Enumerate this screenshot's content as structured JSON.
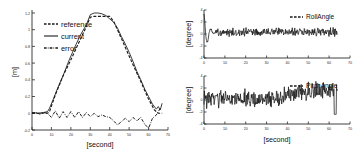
{
  "figure": {
    "background": "#ffffff",
    "foreground": "#1a1a1a"
  },
  "chart_data": [
    {
      "id": "position-tracking",
      "type": "line",
      "title": "",
      "xlabel": "[second]",
      "ylabel": "[m]",
      "xlim": [
        0,
        70
      ],
      "ylim": [
        -0.2,
        1.2
      ],
      "xticks": [
        0,
        10,
        20,
        30,
        40,
        50,
        60,
        70
      ],
      "xticklabels": [
        "0",
        "10",
        "20",
        "30",
        "40",
        "50",
        "60",
        "70"
      ],
      "yticks": [
        -0.2,
        0,
        0.2,
        0.4,
        0.6,
        0.8,
        1,
        1.2
      ],
      "yticklabels": [
        "-0.2",
        "0",
        "0.2",
        "0.4",
        "0.6",
        "0.8",
        "1",
        "1.2"
      ],
      "grid": false,
      "legend_position": "upper-left",
      "series": [
        {
          "name": "reference",
          "style": "dashed",
          "x": [
            0,
            4,
            8,
            9,
            12,
            16,
            20,
            24,
            28,
            30,
            32,
            36,
            40,
            42,
            44,
            48,
            52,
            56,
            60,
            63,
            65,
            67
          ],
          "values": [
            0,
            0,
            0,
            0.02,
            0.22,
            0.45,
            0.64,
            0.84,
            1.04,
            1.15,
            1.16,
            1.16,
            1.16,
            1.1,
            1.0,
            0.79,
            0.58,
            0.38,
            0.17,
            0.04,
            0.0,
            0.0
          ]
        },
        {
          "name": "current",
          "style": "solid",
          "x": [
            0,
            3,
            6,
            8,
            9,
            11,
            13,
            16,
            19,
            22,
            25,
            28,
            30,
            32,
            34,
            36,
            38,
            40,
            42,
            44,
            46,
            48,
            50,
            52,
            54,
            56,
            58,
            60,
            62,
            64,
            65,
            66,
            67
          ],
          "values": [
            0.01,
            0.0,
            0.01,
            0.02,
            0.06,
            0.17,
            0.29,
            0.45,
            0.63,
            0.79,
            0.94,
            1.06,
            1.18,
            1.2,
            1.2,
            1.19,
            1.17,
            1.13,
            1.09,
            1.02,
            0.92,
            0.83,
            0.73,
            0.62,
            0.5,
            0.4,
            0.29,
            0.2,
            0.11,
            0.05,
            0.08,
            0.04,
            0.12
          ]
        },
        {
          "name": "error",
          "style": "dashdot",
          "x": [
            0,
            2,
            4,
            6,
            8,
            10,
            12,
            14,
            16,
            18,
            20,
            22,
            24,
            26,
            28,
            30,
            32,
            34,
            36,
            38,
            40,
            42,
            44,
            46,
            48,
            50,
            52,
            54,
            56,
            58,
            60,
            62,
            64,
            66
          ],
          "values": [
            0.0,
            0.01,
            -0.01,
            0.01,
            0.0,
            -0.05,
            0.03,
            -0.06,
            0.02,
            -0.05,
            0.02,
            -0.05,
            0.02,
            -0.05,
            0.01,
            -0.04,
            0.0,
            -0.04,
            -0.02,
            -0.04,
            -0.05,
            -0.09,
            -0.14,
            -0.1,
            -0.06,
            -0.1,
            -0.05,
            -0.09,
            -0.05,
            -0.13,
            -0.18,
            -0.06,
            -0.02,
            0.06
          ]
        }
      ]
    },
    {
      "id": "roll-angle",
      "type": "line",
      "title": "",
      "xlabel": "",
      "ylabel": "[degree]",
      "xlim": [
        0,
        70
      ],
      "ylim": [
        -4,
        4
      ],
      "xticks": [
        0,
        10,
        20,
        30,
        40,
        50,
        60,
        70
      ],
      "xticklabels": [
        "0",
        "10",
        "20",
        "30",
        "40",
        "50",
        "60",
        "70"
      ],
      "yticks": [
        -4,
        -2,
        0,
        2,
        4
      ],
      "yticklabels": [
        "-4",
        "-2",
        "0",
        "2",
        "4"
      ],
      "grid": false,
      "legend_position": "upper-right",
      "series": [
        {
          "name": "RollAngle",
          "style": "dashed",
          "mean": 0.35,
          "noise_amplitude": 0.55,
          "description": "Large transient swing near t=2-5 reaching +3.5 and -2.5, then settles to dense band around +0.4 degrees for remainder of run, ending near t=64."
        }
      ]
    },
    {
      "id": "pitch-angle",
      "type": "line",
      "title": "",
      "xlabel": "[second]",
      "ylabel": "[degree]",
      "xlim": [
        0,
        70
      ],
      "ylim": [
        -4,
        4
      ],
      "xticks": [
        0,
        10,
        20,
        30,
        40,
        50,
        60,
        70
      ],
      "xticklabels": [
        "0",
        "10",
        "20",
        "30",
        "40",
        "50",
        "60",
        "70"
      ],
      "yticks": [
        -4,
        -2,
        0,
        2,
        4
      ],
      "yticklabels": [
        "-4",
        "-2",
        "0",
        "2",
        "4"
      ],
      "grid": false,
      "legend_position": "upper-right",
      "series": [
        {
          "name": "PitchAngle",
          "style": "dashed",
          "mean": 0.2,
          "noise_amplitude": 1.1,
          "description": "Dense noisy oscillation around 0 degrees for t=0-38, drifting upward to about +1.5 degrees between t=40-62, with a sharp downward spike to -2.5 near t=63."
        }
      ]
    }
  ],
  "panels": {
    "left": {
      "name": "position-tracking-panel",
      "xlabel": "[second]",
      "ylabel": "[m]",
      "legend": [
        {
          "label": "reference",
          "style": "dashed"
        },
        {
          "label": "current",
          "style": "solid"
        },
        {
          "label": "error",
          "style": "dashdot"
        }
      ]
    },
    "roll": {
      "name": "roll-angle-panel",
      "ylabel": "[degree]",
      "legend": [
        {
          "label": "RollAngle",
          "style": "dashed"
        }
      ]
    },
    "pitch": {
      "name": "pitch-angle-panel",
      "xlabel": "[second]",
      "ylabel": "[degree]",
      "legend": [
        {
          "label": "PitchAngle",
          "style": "dashed"
        }
      ]
    }
  }
}
